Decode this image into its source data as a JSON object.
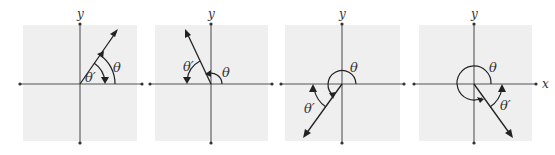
{
  "figure": {
    "axis_labels": {
      "x": "x",
      "y": "y"
    },
    "colors": {
      "panel_background": "#efefef",
      "axis": "#555555",
      "ray": "#222222",
      "label": "#333333"
    },
    "panels": [
      {
        "quadrant": "I",
        "theta_label": "θ",
        "theta_prime_label": "θ′"
      },
      {
        "quadrant": "II",
        "theta_label": "θ",
        "theta_prime_label": "θ′"
      },
      {
        "quadrant": "III",
        "theta_label": "θ",
        "theta_prime_label": "θ′"
      },
      {
        "quadrant": "IV",
        "theta_label": "θ",
        "theta_prime_label": "θ′"
      }
    ]
  }
}
